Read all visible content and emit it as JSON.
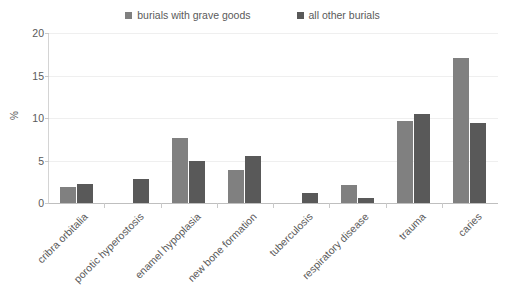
{
  "legend": {
    "position": "top-center",
    "entries": [
      {
        "label": "burials with grave goods",
        "color": "#808080",
        "marker": "square-marker"
      },
      {
        "label": "all other burials",
        "color": "#595959",
        "marker": "square-marker"
      }
    ]
  },
  "axes": {
    "y_title": "%",
    "y_ticks": [
      "0",
      "5",
      "10",
      "15",
      "20"
    ]
  },
  "chart_data": {
    "type": "bar",
    "title": "",
    "subtitle": "",
    "xlabel": "",
    "ylabel": "%",
    "ylim": [
      0,
      20
    ],
    "ytick_values": [
      0,
      5,
      10,
      15,
      20
    ],
    "grid": "horizontal",
    "legend_position": "top-center",
    "categories": [
      "cribra orbitalia",
      "porotic hyperostosis",
      "enamel hypoplasia",
      "new bone formation",
      "tuberculosis",
      "respiratory disease",
      "trauma",
      "caries"
    ],
    "series": [
      {
        "name": "burials with grave goods",
        "color": "#808080",
        "values": [
          1.9,
          0,
          7.6,
          3.9,
          0,
          2.1,
          9.6,
          17.1
        ]
      },
      {
        "name": "all other burials",
        "color": "#595959",
        "values": [
          2.2,
          2.8,
          5.0,
          5.5,
          1.2,
          0.6,
          10.5,
          9.4
        ]
      }
    ]
  }
}
